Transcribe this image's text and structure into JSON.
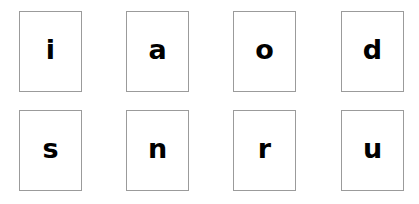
{
  "canvas": {
    "width": 419,
    "height": 204,
    "background_color": "#ffffff"
  },
  "style": {
    "card_border_color": "#9b9b9b",
    "card_fill_color": "#ffffff",
    "letter_color": "#000000"
  },
  "grid": {
    "rows": 2,
    "columns": 4,
    "card_width": 63,
    "card_height": 81
  },
  "cards": [
    {
      "letter": "i",
      "row": 0,
      "column": 0
    },
    {
      "letter": "a",
      "row": 0,
      "column": 1
    },
    {
      "letter": "o",
      "row": 0,
      "column": 2
    },
    {
      "letter": "d",
      "row": 0,
      "column": 3
    },
    {
      "letter": "s",
      "row": 1,
      "column": 0
    },
    {
      "letter": "n",
      "row": 1,
      "column": 1
    },
    {
      "letter": "r",
      "row": 1,
      "column": 2
    },
    {
      "letter": "u",
      "row": 1,
      "column": 3
    }
  ]
}
